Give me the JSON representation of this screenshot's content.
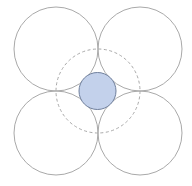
{
  "diagram": {
    "outer_circles": [
      {
        "id": "top-left",
        "cx": 56,
        "cy": 49,
        "r": 42
      },
      {
        "id": "top-right",
        "cx": 140,
        "cy": 49,
        "r": 42
      },
      {
        "id": "bottom-left",
        "cx": 56,
        "cy": 133,
        "r": 42
      },
      {
        "id": "bottom-right",
        "cx": 140,
        "cy": 133,
        "r": 42
      }
    ],
    "dashed_circle": {
      "cx": 98,
      "cy": 91,
      "r": 42
    },
    "inner_circle": {
      "cx": 97.5,
      "cy": 91,
      "r": 18.5
    },
    "colors": {
      "outer_stroke": "#a9a9a9",
      "dashed_stroke": "#a9a9a9",
      "inner_fill": "#c3d1eb",
      "inner_stroke": "#6f7f9c"
    }
  }
}
